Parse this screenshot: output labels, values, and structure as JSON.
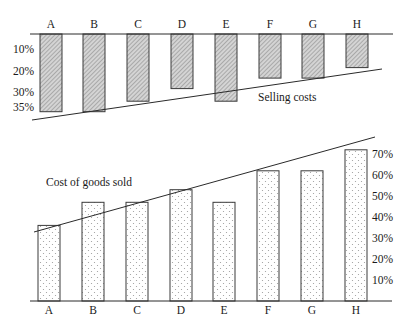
{
  "chart_data": [
    {
      "type": "bar",
      "title": "Selling costs",
      "orientation": "downward from top baseline",
      "categories": [
        "A",
        "B",
        "C",
        "D",
        "E",
        "F",
        "G",
        "H"
      ],
      "values": [
        37,
        37,
        32,
        26,
        32,
        21,
        21,
        16
      ],
      "unit": "%",
      "yticks": [
        "10%",
        "20%",
        "30%",
        "35%"
      ],
      "ytick_values": [
        10,
        20,
        30,
        35
      ],
      "axis_side": "left",
      "annotation": "Selling costs",
      "trend_line": "descending line below bars, rising left to right",
      "fill": "diagonal hatch",
      "ylim": [
        0,
        37
      ]
    },
    {
      "type": "bar",
      "title": "Cost of goods sold",
      "orientation": "upward from bottom baseline",
      "categories": [
        "A",
        "B",
        "C",
        "D",
        "E",
        "F",
        "G",
        "H"
      ],
      "values": [
        36,
        47,
        47,
        53,
        47,
        62,
        62,
        72
      ],
      "unit": "%",
      "yticks": [
        "10%",
        "20%",
        "30%",
        "40%",
        "50%",
        "60%",
        "70%"
      ],
      "ytick_values": [
        10,
        20,
        30,
        40,
        50,
        60,
        70
      ],
      "axis_side": "right",
      "annotation": "Cost of goods sold",
      "trend_line": "ascending line across bar tops",
      "fill": "dot stipple",
      "ylim": [
        0,
        72
      ]
    }
  ]
}
